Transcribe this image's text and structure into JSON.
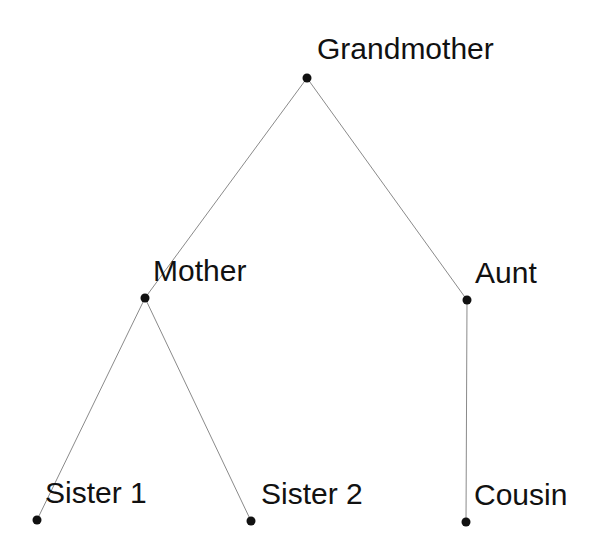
{
  "diagram": {
    "type": "family-tree",
    "line_color": "#8a8a8a",
    "node_color": "#111111",
    "nodes": [
      {
        "id": "grandmother",
        "label": "Grandmother",
        "x": 307,
        "y": 78,
        "label_x": 317,
        "label_y": 34
      },
      {
        "id": "mother",
        "label": "Mother",
        "x": 145,
        "y": 298,
        "label_x": 153,
        "label_y": 256
      },
      {
        "id": "aunt",
        "label": "Aunt",
        "x": 467,
        "y": 300,
        "label_x": 475,
        "label_y": 258
      },
      {
        "id": "sister1",
        "label": "Sister 1",
        "x": 37,
        "y": 520,
        "label_x": 45,
        "label_y": 478
      },
      {
        "id": "sister2",
        "label": "Sister 2",
        "x": 251,
        "y": 521,
        "label_x": 261,
        "label_y": 479
      },
      {
        "id": "cousin",
        "label": "Cousin",
        "x": 466,
        "y": 522,
        "label_x": 474,
        "label_y": 480
      }
    ],
    "edges": [
      {
        "from": "grandmother",
        "to": "mother"
      },
      {
        "from": "grandmother",
        "to": "aunt"
      },
      {
        "from": "mother",
        "to": "sister1"
      },
      {
        "from": "mother",
        "to": "sister2"
      },
      {
        "from": "aunt",
        "to": "cousin"
      }
    ]
  },
  "labels": {
    "grandmother": "Grandmother",
    "mother": "Mother",
    "aunt": "Aunt",
    "sister1": "Sister 1",
    "sister2": "Sister 2",
    "cousin": "Cousin"
  }
}
